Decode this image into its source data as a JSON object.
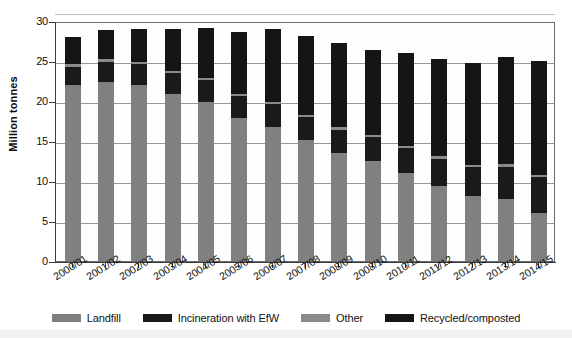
{
  "chart_data": {
    "type": "bar",
    "subtype": "stacked-bar",
    "title": "",
    "xlabel": "",
    "ylabel": "Million tonnes",
    "ylim": [
      0,
      30
    ],
    "ytick_step": 5,
    "yticks": [
      "0",
      "5",
      "10",
      "15",
      "20",
      "25",
      "30"
    ],
    "grid": true,
    "grid_axis": "y",
    "legend_position": "bottom",
    "categories": [
      "2000/01",
      "2001/02",
      "2002/03",
      "2003/04",
      "2004/05",
      "2005/06",
      "2006/07",
      "2007/08",
      "2008/09",
      "2008/10",
      "2010/11",
      "2011/12",
      "2012/13",
      "2013/14",
      "2014/15"
    ],
    "series": [
      {
        "name": "Landfill",
        "color": "#808080",
        "values": [
          22.0,
          22.4,
          22.0,
          20.9,
          19.9,
          17.9,
          16.8,
          15.1,
          13.5,
          12.5,
          11.0,
          9.4,
          8.1,
          7.7,
          6.0
        ]
      },
      {
        "name": "Incineration with EfW",
        "color": "#1a1a1a",
        "values": [
          2.3,
          2.5,
          2.6,
          2.6,
          2.7,
          2.7,
          2.8,
          2.9,
          2.9,
          3.0,
          3.1,
          3.4,
          3.6,
          4.1,
          4.5
        ]
      },
      {
        "name": "Other",
        "color": "#8a8a8a",
        "values": [
          0.3,
          0.3,
          0.3,
          0.3,
          0.3,
          0.3,
          0.3,
          0.3,
          0.3,
          0.3,
          0.3,
          0.3,
          0.3,
          0.3,
          0.3
        ]
      },
      {
        "name": "Recycled/composted",
        "color": "#151515",
        "values": [
          3.4,
          3.7,
          4.1,
          5.2,
          6.2,
          7.7,
          9.1,
          9.8,
          10.5,
          10.6,
          11.6,
          12.2,
          12.7,
          13.4,
          14.2
        ]
      }
    ],
    "totals": [
      28.0,
      28.9,
      29.0,
      29.0,
      29.1,
      28.6,
      29.0,
      28.1,
      27.2,
      26.4,
      26.0,
      25.3,
      24.7,
      25.5,
      25.0
    ]
  },
  "legend": {
    "items": [
      {
        "label": "Landfill",
        "color": "#808080"
      },
      {
        "label": "Incineration with EfW",
        "color": "#1a1a1a"
      },
      {
        "label": "Other",
        "color": "#8a8a8a"
      },
      {
        "label": "Recycled/composted",
        "color": "#151515"
      }
    ]
  }
}
